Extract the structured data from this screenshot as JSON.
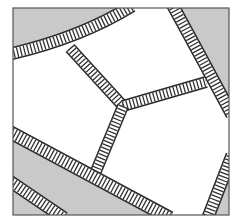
{
  "figure": {
    "type": "schematic illustration",
    "colors": {
      "background": "#ffffff",
      "cell_fill_shaded": "#c8c8c8",
      "band_outline": "#2a2a2a",
      "band_stripe": "#333333",
      "frame": "#555555"
    },
    "regions": [
      {
        "name": "top-left-shaded-cell",
        "shade": "gray"
      },
      {
        "name": "top-right-shaded-cell",
        "shade": "gray"
      },
      {
        "name": "lower-left-shaded-cell",
        "shade": "gray"
      },
      {
        "name": "bottom-right-shaded-corner",
        "shade": "gray"
      },
      {
        "name": "central-white-cells",
        "shade": "white"
      }
    ],
    "bands": [
      "top-left-curved-band",
      "top-right-curved-band",
      "upper-diagonal-band",
      "right-horizontal-band",
      "lower-diagonal-band",
      "lower-left-long-band",
      "lower-left-corner-band",
      "bottom-right-band"
    ],
    "labels": []
  }
}
